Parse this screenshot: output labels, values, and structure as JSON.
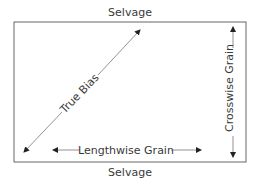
{
  "diagram": {
    "labels": {
      "top_edge": "Selvage",
      "bottom_edge": "Selvage",
      "bias": "True Bias",
      "lengthwise": "Lengthwise Grain",
      "crosswise": "Crosswise Grain"
    },
    "colors": {
      "line": "#555555",
      "text": "#3a3a3a",
      "background": "#ffffff"
    }
  }
}
